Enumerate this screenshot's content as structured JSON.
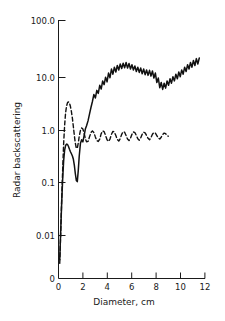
{
  "chart_data": {
    "type": "line",
    "title": "",
    "xlabel": "Diameter, cm",
    "ylabel": "Radar backscattering",
    "xlim": [
      0,
      12
    ],
    "ylim": [
      0.002,
      100.0
    ],
    "yscale": "log",
    "xscale": "linear",
    "grid": false,
    "legend": "none",
    "xticks": [
      "0",
      "2",
      "4",
      "6",
      "8",
      "10",
      "12"
    ],
    "xtick_values": [
      0,
      2,
      4,
      6,
      8,
      10,
      12
    ],
    "yticks": [
      "100.0",
      "10.0",
      "1.0",
      "0.1",
      "0.01"
    ],
    "ytick_values": [
      100.0,
      10.0,
      1.0,
      0.1,
      0.01
    ],
    "origin_label_x": "0",
    "origin_label_y": "0",
    "series": [
      {
        "name": "solid-curve",
        "style": "solid",
        "color": "#111111",
        "x": [
          0.1,
          0.18,
          0.26,
          0.34,
          0.42,
          0.5,
          0.58,
          0.66,
          0.74,
          0.82,
          0.9,
          0.98,
          1.06,
          1.14,
          1.22,
          1.3,
          1.38,
          1.46,
          1.54,
          1.62,
          1.7,
          1.8,
          1.9,
          2.0,
          2.1,
          2.2,
          2.3,
          2.42,
          2.54,
          2.66,
          2.78,
          2.9,
          3.02,
          3.14,
          3.26,
          3.38,
          3.5,
          3.62,
          3.74,
          3.86,
          3.98,
          4.1,
          4.22,
          4.34,
          4.46,
          4.58,
          4.7,
          4.82,
          4.94,
          5.06,
          5.18,
          5.3,
          5.42,
          5.54,
          5.66,
          5.78,
          5.9,
          6.02,
          6.14,
          6.26,
          6.38,
          6.5,
          6.62,
          6.74,
          6.86,
          6.98,
          7.1,
          7.22,
          7.34,
          7.46,
          7.58,
          7.7,
          7.82,
          7.94,
          8.06,
          8.18,
          8.3,
          8.42,
          8.54,
          8.66,
          8.78,
          8.9,
          9.02,
          9.14,
          9.26,
          9.38,
          9.5,
          9.62,
          9.74,
          9.86,
          9.98,
          10.1,
          10.22,
          10.34,
          10.46,
          10.58,
          10.7,
          10.82,
          10.94,
          11.06,
          11.18,
          11.3,
          11.42,
          11.54
        ],
        "y": [
          0.0035,
          0.012,
          0.04,
          0.11,
          0.24,
          0.38,
          0.47,
          0.5,
          0.49,
          0.45,
          0.4,
          0.36,
          0.33,
          0.3,
          0.26,
          0.2,
          0.14,
          0.105,
          0.1,
          0.16,
          0.3,
          0.52,
          0.6,
          0.55,
          0.72,
          0.95,
          1.1,
          1.35,
          1.8,
          2.4,
          3.1,
          4.2,
          3.6,
          5.0,
          4.4,
          6.2,
          5.3,
          7.5,
          6.4,
          8.8,
          7.2,
          10.5,
          8.6,
          12.5,
          10.0,
          13.5,
          11.0,
          14.5,
          12.0,
          15.5,
          12.8,
          16.0,
          13.2,
          16.5,
          13.0,
          15.8,
          12.5,
          15.0,
          12.0,
          14.2,
          11.2,
          13.5,
          10.8,
          13.0,
          10.2,
          12.5,
          9.8,
          12.0,
          9.5,
          11.8,
          9.2,
          11.5,
          8.5,
          10.5,
          7.0,
          8.5,
          5.6,
          7.0,
          5.2,
          6.8,
          5.5,
          7.5,
          6.2,
          8.2,
          6.8,
          9.0,
          7.5,
          10.0,
          8.2,
          11.0,
          9.0,
          12.0,
          10.0,
          13.5,
          11.2,
          15.0,
          12.5,
          16.5,
          13.5,
          18.0,
          14.5,
          19.5,
          15.5,
          20.0
        ],
        "end_x": 11.54,
        "end_y": 20.0
      },
      {
        "name": "dashed-curve",
        "style": "dashed",
        "color": "#111111",
        "x": [
          0.1,
          0.18,
          0.26,
          0.34,
          0.42,
          0.5,
          0.58,
          0.66,
          0.74,
          0.82,
          0.9,
          0.98,
          1.06,
          1.14,
          1.22,
          1.3,
          1.38,
          1.46,
          1.54,
          1.62,
          1.7,
          1.8,
          1.9,
          2.0,
          2.1,
          2.2,
          2.3,
          2.42,
          2.54,
          2.66,
          2.78,
          2.9,
          3.02,
          3.14,
          3.26,
          3.38,
          3.5,
          3.62,
          3.74,
          3.86,
          3.98,
          4.1,
          4.22,
          4.34,
          4.46,
          4.58,
          4.7,
          4.82,
          4.94,
          5.06,
          5.18,
          5.3,
          5.42,
          5.54,
          5.66,
          5.78,
          5.9,
          6.02,
          6.14,
          6.26,
          6.38,
          6.5,
          6.62,
          6.74,
          6.86,
          6.98,
          7.1,
          7.22,
          7.34,
          7.46,
          7.58,
          7.7,
          7.82,
          7.94,
          8.06,
          8.18,
          8.3,
          8.42,
          8.54,
          8.66,
          8.78,
          8.9,
          9.0
        ],
        "y": [
          0.003,
          0.011,
          0.045,
          0.16,
          0.5,
          1.1,
          1.9,
          2.55,
          2.95,
          3.05,
          2.9,
          2.5,
          2.0,
          1.5,
          1.05,
          0.72,
          0.52,
          0.42,
          0.42,
          0.52,
          0.7,
          0.9,
          1.0,
          0.95,
          0.8,
          0.63,
          0.55,
          0.56,
          0.68,
          0.82,
          0.88,
          0.82,
          0.68,
          0.58,
          0.56,
          0.62,
          0.78,
          0.88,
          0.85,
          0.72,
          0.6,
          0.56,
          0.62,
          0.76,
          0.86,
          0.84,
          0.72,
          0.61,
          0.57,
          0.63,
          0.76,
          0.85,
          0.83,
          0.72,
          0.62,
          0.58,
          0.64,
          0.76,
          0.84,
          0.82,
          0.72,
          0.63,
          0.59,
          0.65,
          0.76,
          0.83,
          0.81,
          0.72,
          0.64,
          0.6,
          0.66,
          0.76,
          0.82,
          0.8,
          0.72,
          0.65,
          0.62,
          0.67,
          0.75,
          0.8,
          0.78,
          0.72,
          0.7
        ],
        "end_x": 9.0,
        "end_y": 0.7
      }
    ]
  },
  "axes": {
    "x_title": "Diameter, cm",
    "y_title": "Radar backscattering"
  }
}
